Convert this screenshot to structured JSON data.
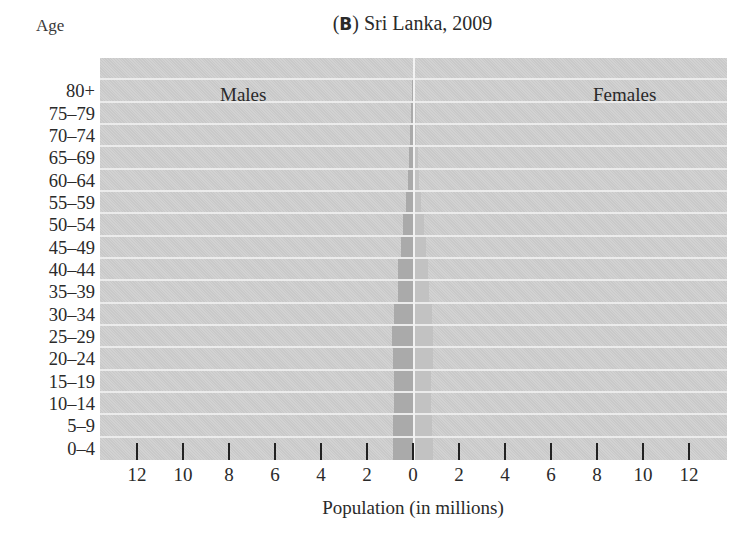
{
  "chart_data": {
    "type": "bar",
    "subtype": "population-pyramid",
    "title": "(B) Sri Lanka, 2009",
    "title_letter": "B",
    "title_text": "Sri Lanka, 2009",
    "ylabel": "Age",
    "xlabel": "Population (in millions)",
    "categories": [
      "0–4",
      "5–9",
      "10–14",
      "15–19",
      "20–24",
      "25–29",
      "30–34",
      "35–39",
      "40–44",
      "45–49",
      "50–54",
      "55–59",
      "60–64",
      "65–69",
      "70–74",
      "75–79",
      "80+"
    ],
    "series": [
      {
        "name": "Males",
        "side": "left",
        "color": "#aaaaaa",
        "values": [
          0.87,
          0.85,
          0.81,
          0.81,
          0.85,
          0.9,
          0.81,
          0.67,
          0.64,
          0.52,
          0.42,
          0.32,
          0.23,
          0.17,
          0.12,
          0.09,
          0.06
        ]
      },
      {
        "name": "Females",
        "side": "right",
        "color": "#c2c2c2",
        "values": [
          0.85,
          0.83,
          0.8,
          0.8,
          0.86,
          0.88,
          0.83,
          0.7,
          0.66,
          0.56,
          0.46,
          0.35,
          0.27,
          0.21,
          0.15,
          0.11,
          0.09
        ]
      }
    ],
    "x_ticks_left": [
      "12",
      "10",
      "8",
      "6",
      "4",
      "2"
    ],
    "x_ticks_center": "0",
    "x_ticks_right": [
      "2",
      "4",
      "6",
      "8",
      "10",
      "12"
    ],
    "xlim": [
      -13.6,
      13.6
    ],
    "grid": "horizontal white row separators",
    "legend": "inline labels: Males (left), Females (right)"
  },
  "labels": {
    "age": "Age",
    "title_letter": "B",
    "title_text": "Sri Lanka, 2009",
    "males": "Males",
    "females": "Females",
    "xlabel": "Population (in millions)"
  }
}
